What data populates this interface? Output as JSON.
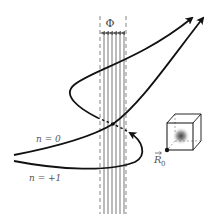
{
  "figure": {
    "flux_label": "Φ",
    "path_labels": [
      {
        "id": "n0",
        "text": "n = 0"
      },
      {
        "id": "n1",
        "text": "n = +1"
      }
    ],
    "position_label": "R",
    "position_subscript": "0",
    "flux_lines_count": 6,
    "colors": {
      "ink": "#111111",
      "flux": "#666666",
      "label": "#555555"
    }
  }
}
